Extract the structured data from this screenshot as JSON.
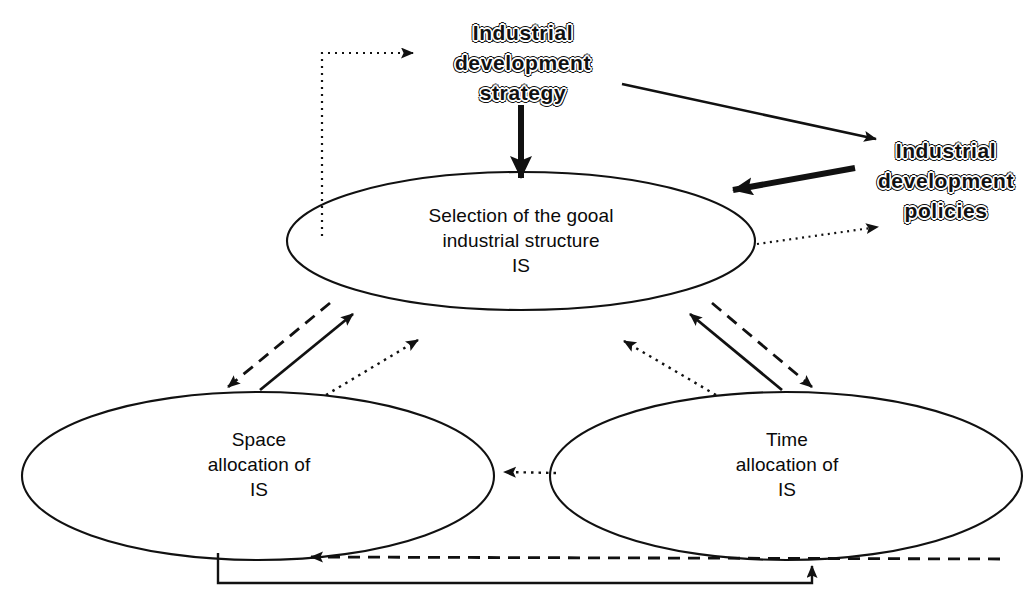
{
  "diagram": {
    "background_color": "#ffffff",
    "line_color": "#111111",
    "text_color": "#0a0a0a",
    "nodes": [
      {
        "id": "strategy",
        "shape": "text",
        "style": "outlined-bold",
        "label": "Industrial\ndevelopment\nstrategy",
        "cx": 523,
        "cy": 63
      },
      {
        "id": "policies",
        "shape": "text",
        "style": "outlined-bold",
        "label": "Industrial\ndevelopment\npolicies",
        "cx": 946,
        "cy": 181
      },
      {
        "id": "goal-structure",
        "shape": "ellipse",
        "label": "Selection of the gooal\nindustrial structure\nIS",
        "cx": 521,
        "cy": 241,
        "rx": 234,
        "ry": 69
      },
      {
        "id": "space-allocation",
        "shape": "ellipse",
        "label": "Space\nallocation of\nIS",
        "cx": 258,
        "cy": 476,
        "rx": 236,
        "ry": 84
      },
      {
        "id": "time-allocation",
        "shape": "ellipse",
        "label": "Time\nallocation of\nIS",
        "cx": 786,
        "cy": 476,
        "rx": 236,
        "ry": 84
      }
    ],
    "edges": [
      {
        "id": "goal-to-strategy-feedback",
        "from": "goal-structure",
        "to": "strategy",
        "style": "dotted",
        "weight": "thin",
        "path": "elbow-up-right"
      },
      {
        "id": "strategy-to-policies",
        "from": "strategy",
        "to": "policies",
        "style": "solid",
        "weight": "thin",
        "path": "diagonal-down-right"
      },
      {
        "id": "strategy-to-goal",
        "from": "strategy",
        "to": "goal-structure",
        "style": "solid",
        "weight": "thick",
        "path": "vertical-down"
      },
      {
        "id": "policies-to-goal",
        "from": "policies",
        "to": "goal-structure",
        "style": "solid",
        "weight": "thick",
        "path": "diagonal-down-left"
      },
      {
        "id": "goal-to-policies-feedback",
        "from": "goal-structure",
        "to": "policies",
        "style": "dotted",
        "weight": "thin",
        "path": "diagonal-up-right"
      },
      {
        "id": "goal-to-space-dashed",
        "from": "goal-structure",
        "to": "space-allocation",
        "style": "dashed",
        "weight": "thin",
        "path": "diagonal-down-left"
      },
      {
        "id": "space-to-goal-solid",
        "from": "space-allocation",
        "to": "goal-structure",
        "style": "solid",
        "weight": "thin",
        "path": "diagonal-up-right"
      },
      {
        "id": "space-to-goal-dotted",
        "from": "space-allocation",
        "to": "goal-structure",
        "style": "dotted",
        "weight": "thin",
        "path": "diagonal-up-right"
      },
      {
        "id": "goal-to-time-dashed",
        "from": "goal-structure",
        "to": "time-allocation",
        "style": "dashed",
        "weight": "thin",
        "path": "diagonal-down-right"
      },
      {
        "id": "time-to-goal-solid",
        "from": "time-allocation",
        "to": "goal-structure",
        "style": "solid",
        "weight": "thin",
        "path": "diagonal-up-left"
      },
      {
        "id": "time-to-goal-dotted",
        "from": "time-allocation",
        "to": "goal-structure",
        "style": "dotted",
        "weight": "thin",
        "path": "diagonal-up-left"
      },
      {
        "id": "time-to-space-dotted",
        "from": "time-allocation",
        "to": "space-allocation",
        "style": "dotted",
        "weight": "thin",
        "path": "horizontal-left"
      },
      {
        "id": "time-to-space-dashed-bottom",
        "from": "time-allocation",
        "to": "space-allocation",
        "style": "dashed",
        "weight": "thin",
        "path": "horizontal-left-bottom"
      },
      {
        "id": "space-to-time-solid-bottom",
        "from": "space-allocation",
        "to": "time-allocation",
        "style": "solid",
        "weight": "thin",
        "path": "elbow-down-right-up"
      }
    ]
  }
}
